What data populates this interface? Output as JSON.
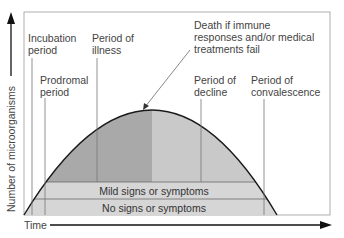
{
  "axes": {
    "x_label": "Time",
    "y_label": "Number of microorganisms"
  },
  "stages": [
    {
      "id": "incubation",
      "lines": [
        "Incubation",
        "period"
      ]
    },
    {
      "id": "prodromal",
      "lines": [
        "Prodromal",
        "period"
      ]
    },
    {
      "id": "illness",
      "lines": [
        "Period of",
        "illness"
      ]
    },
    {
      "id": "decline",
      "lines": [
        "Period of",
        "decline"
      ]
    },
    {
      "id": "convalescence",
      "lines": [
        "Period of",
        "convalescence"
      ]
    }
  ],
  "annotation": {
    "lines": [
      "Death if immune",
      "responses and/or medical",
      "treatments fail"
    ]
  },
  "bands": {
    "mild": "Mild signs or symptoms",
    "none": "No signs or symptoms"
  },
  "colors": {
    "rising_fill": "#a9a9a9",
    "falling_fill": "#c9c9c9",
    "band_fill": "#d6d6d6",
    "curve": "#1a1a1a",
    "frame": "#9a9a9a"
  }
}
